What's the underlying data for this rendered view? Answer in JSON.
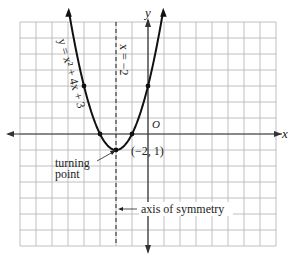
{
  "chart_data": {
    "type": "line",
    "title": "",
    "function": "y = x^2 + 4x + 3",
    "curve_label": "y = x² + 4x + 3",
    "xlabel": "x",
    "ylabel": "y",
    "origin_label": "O",
    "xlim": [
      -8,
      8
    ],
    "ylim": [
      -7,
      7
    ],
    "grid": true,
    "axis_of_symmetry": {
      "x": -2,
      "label": "x = −2"
    },
    "vertex": {
      "x": -2,
      "y": -1,
      "label": "(−2, 1)"
    },
    "marked_points": [
      {
        "x": -4,
        "y": 3
      },
      {
        "x": -3,
        "y": 0
      },
      {
        "x": -2,
        "y": -1
      },
      {
        "x": -1,
        "y": 0
      },
      {
        "x": 0,
        "y": 3
      }
    ],
    "annotations": {
      "turning_point_line1": "turning",
      "turning_point_line2": "point",
      "axis_of_symmetry_text": "axis of symmetry"
    },
    "colors": {
      "curve": "#111111",
      "grid": "#b0b0b0",
      "axis": "#333333"
    }
  }
}
